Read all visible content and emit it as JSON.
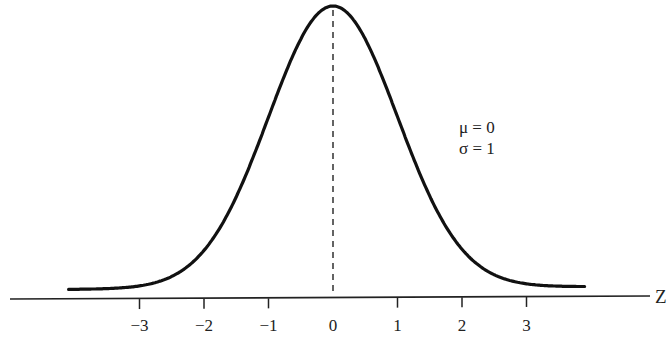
{
  "chart_data": {
    "type": "line",
    "title": "",
    "xlabel": "Z",
    "ylabel": "",
    "series": [
      {
        "name": "Standard normal density",
        "mu": 0,
        "sigma": 1,
        "x": [
          -4,
          -3,
          -2,
          -1,
          0,
          1,
          2,
          3,
          4
        ],
        "values": [
          0.0001,
          0.0044,
          0.054,
          0.242,
          0.399,
          0.242,
          0.054,
          0.0044,
          0.0001
        ]
      }
    ],
    "x_ticks": [
      -3,
      -2,
      -1,
      0,
      1,
      2,
      3
    ],
    "x_tick_labels": [
      "−3",
      "−2",
      "−1",
      "0",
      "1",
      "2",
      "3"
    ],
    "xlim": [
      -4.2,
      4.8
    ],
    "grid": false,
    "legend": null,
    "annotations": [
      "μ = 0",
      "σ = 1"
    ],
    "mean_line": {
      "x": 0,
      "style": "dashed"
    }
  },
  "labels": {
    "axis": "Z",
    "mu": "μ = 0",
    "sigma": "σ = 1"
  }
}
